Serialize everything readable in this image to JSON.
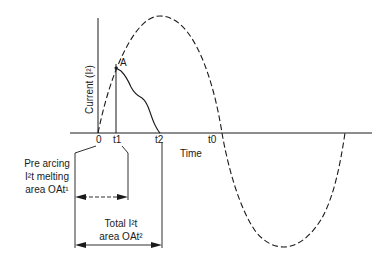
{
  "diagram": {
    "type": "fuse I2t time-current diagram",
    "axes": {
      "y_label": "Current (I²)",
      "x_label": "Time"
    },
    "tick_labels": {
      "origin": "0",
      "t1": "t1",
      "t2": "t2",
      "t0": "t0"
    },
    "point_label": "A",
    "annotations": {
      "pre_arcing": [
        "Pre arcing",
        "I²t melting",
        "area OAt¹"
      ],
      "total": [
        "Total I²t",
        "area OAt²"
      ]
    },
    "curves": [
      {
        "name": "prospective current (dashed sine)",
        "style": "dashed"
      },
      {
        "name": "actual let-through current",
        "style": "solid"
      }
    ],
    "colors": {
      "ink": "#1a1a1a",
      "background": "#ffffff"
    }
  }
}
